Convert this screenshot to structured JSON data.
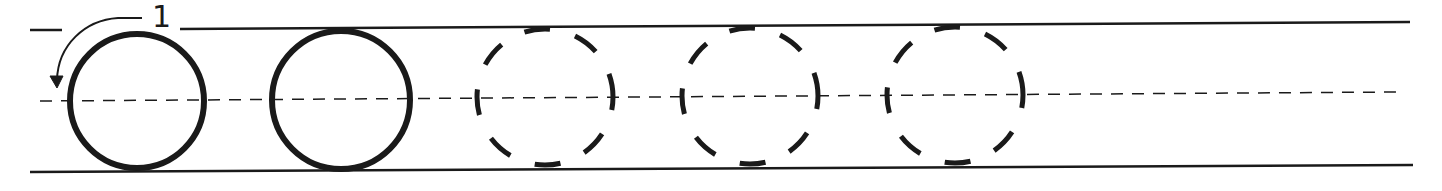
{
  "worksheet": {
    "letter": "O",
    "stroke_order_label": "1",
    "colors": {
      "ink": "#1a1a1a",
      "background": "#ffffff"
    },
    "guide_lines": {
      "top_y": 29,
      "mid_y": 100,
      "bottom_y": 171
    },
    "models": [
      {
        "type": "solid",
        "cx": 137,
        "cy": 101,
        "r": 67
      },
      {
        "type": "solid",
        "cx": 341,
        "cy": 100,
        "r": 69
      }
    ],
    "trace_guides": [
      {
        "type": "dashed",
        "cx": 545,
        "cy": 97,
        "rx": 68,
        "ry": 68
      },
      {
        "type": "dashed",
        "cx": 750,
        "cy": 96,
        "rx": 68,
        "ry": 68
      },
      {
        "type": "dashed",
        "cx": 955,
        "cy": 95,
        "rx": 68,
        "ry": 68
      }
    ]
  }
}
